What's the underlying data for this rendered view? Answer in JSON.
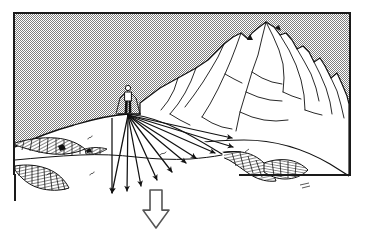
{
  "figure": {
    "title": "Avalanche slope fall-line diagram",
    "kind": "line-art illustration",
    "frame": {
      "visible": true,
      "stroke_color": "#1a1a1a",
      "stroke_width": 2,
      "x": 14,
      "y": 13,
      "width": 336,
      "height": 162
    },
    "sky": {
      "fill_label": "dithered-gray-halftone",
      "color": "#9a9a9a",
      "pattern": "checkerboard-dither"
    },
    "snow": {
      "fill_label": "white-snow",
      "color": "#ffffff"
    },
    "ink_color": "#111111"
  },
  "skier": {
    "label": "skier-on-ridge",
    "x": 128,
    "y": 96,
    "body_color": "#ffffff",
    "legs_color": "#111111",
    "has_poles": true
  },
  "fan": {
    "label": "fall-line-arrow-fan",
    "origin_x": 128,
    "origin_y": 114,
    "arrow_count": 10,
    "stroke_color": "#111111",
    "arrows": [
      {
        "id": "arrow-1",
        "tip_x": 112,
        "tip_y": 193,
        "note": "steepest-left-vertical"
      },
      {
        "id": "arrow-2",
        "tip_x": 127,
        "tip_y": 191
      },
      {
        "id": "arrow-3",
        "tip_x": 141,
        "tip_y": 186
      },
      {
        "id": "arrow-4",
        "tip_x": 157,
        "tip_y": 180
      },
      {
        "id": "arrow-5",
        "tip_x": 172,
        "tip_y": 172
      },
      {
        "id": "arrow-6",
        "tip_x": 186,
        "tip_y": 163
      },
      {
        "id": "arrow-7",
        "tip_x": 196,
        "tip_y": 158
      },
      {
        "id": "arrow-8",
        "tip_x": 215,
        "tip_y": 153
      },
      {
        "id": "arrow-9",
        "tip_x": 233,
        "tip_y": 147
      },
      {
        "id": "arrow-10",
        "tip_x": 232,
        "tip_y": 138,
        "note": "shallowest-right"
      }
    ]
  },
  "main_arrow": {
    "label": "primary-fall-line-arrow",
    "style": "hollow-outline",
    "x": 143,
    "y": 190,
    "width": 26,
    "height": 38,
    "stroke_color": "#555555",
    "fill_color": "#ffffff",
    "direction": "down"
  },
  "mountain": {
    "label": "background-massif",
    "peak_x": 265,
    "peak_y": 33,
    "ridge_line_count": 12
  },
  "terrain_features": [
    {
      "id": "cornice-left",
      "label": "hatched-cornice-left",
      "hatch": true
    },
    {
      "id": "cliff-band-left",
      "label": "hatched-cliff-band-left",
      "hatch": true
    },
    {
      "id": "gully-right",
      "label": "hatched-gully-right",
      "hatch": true
    },
    {
      "id": "convex-roll",
      "label": "convex-snow-roll",
      "hatch": false
    }
  ]
}
